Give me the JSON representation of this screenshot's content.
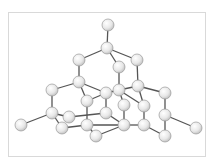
{
  "diagram": {
    "type": "ball-and-stick molecular structure",
    "colors": {
      "atom_fill": "#eeeeee",
      "atom_stroke": "#9a9a9a",
      "bond": "#555555",
      "frame": "#d9d9d9"
    },
    "atom_radius": 6,
    "atoms": [
      {
        "id": 1,
        "x": 108,
        "y": 25
      },
      {
        "id": 2,
        "x": 107,
        "y": 48
      },
      {
        "id": 3,
        "x": 79,
        "y": 60
      },
      {
        "id": 4,
        "x": 119,
        "y": 67
      },
      {
        "id": 5,
        "x": 137,
        "y": 60
      },
      {
        "id": 6,
        "x": 79,
        "y": 82
      },
      {
        "id": 7,
        "x": 52,
        "y": 90
      },
      {
        "id": 8,
        "x": 106,
        "y": 93
      },
      {
        "id": 9,
        "x": 119,
        "y": 90
      },
      {
        "id": 10,
        "x": 138,
        "y": 86
      },
      {
        "id": 11,
        "x": 165,
        "y": 93
      },
      {
        "id": 12,
        "x": 87,
        "y": 101
      },
      {
        "id": 13,
        "x": 124,
        "y": 105
      },
      {
        "id": 14,
        "x": 144,
        "y": 106
      },
      {
        "id": 15,
        "x": 52,
        "y": 113
      },
      {
        "id": 16,
        "x": 69,
        "y": 117
      },
      {
        "id": 17,
        "x": 106,
        "y": 113
      },
      {
        "id": 18,
        "x": 165,
        "y": 115
      },
      {
        "id": 19,
        "x": 21,
        "y": 125
      },
      {
        "id": 20,
        "x": 62,
        "y": 128
      },
      {
        "id": 21,
        "x": 87,
        "y": 125
      },
      {
        "id": 22,
        "x": 124,
        "y": 125
      },
      {
        "id": 23,
        "x": 144,
        "y": 125
      },
      {
        "id": 24,
        "x": 196,
        "y": 128
      },
      {
        "id": 25,
        "x": 96,
        "y": 136
      },
      {
        "id": 26,
        "x": 165,
        "y": 136
      }
    ],
    "bonds": [
      [
        1,
        2
      ],
      [
        2,
        3
      ],
      [
        2,
        4
      ],
      [
        2,
        5
      ],
      [
        3,
        6
      ],
      [
        4,
        9
      ],
      [
        5,
        10
      ],
      [
        6,
        7
      ],
      [
        6,
        8
      ],
      [
        6,
        12
      ],
      [
        7,
        15
      ],
      [
        8,
        9
      ],
      [
        8,
        12
      ],
      [
        9,
        10
      ],
      [
        9,
        13
      ],
      [
        9,
        14
      ],
      [
        10,
        11
      ],
      [
        10,
        14
      ],
      [
        11,
        18
      ],
      [
        12,
        21
      ],
      [
        13,
        22
      ],
      [
        14,
        23
      ],
      [
        15,
        16
      ],
      [
        15,
        19
      ],
      [
        15,
        20
      ],
      [
        16,
        17
      ],
      [
        18,
        24
      ],
      [
        18,
        26
      ],
      [
        20,
        21
      ],
      [
        21,
        22
      ],
      [
        21,
        25
      ],
      [
        22,
        25
      ],
      [
        22,
        23
      ],
      [
        23,
        26
      ],
      [
        8,
        17
      ],
      [
        17,
        22
      ]
    ]
  }
}
